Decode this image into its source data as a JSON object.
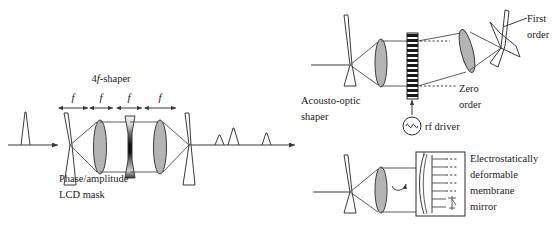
{
  "figure": {
    "background_color": "#ffffff",
    "ink_color": "#3a3a3a",
    "lens_fill_color": "#b4b4b4"
  },
  "panels": {
    "four_f_shaper": {
      "title": "4f-shaper",
      "title_prefix": "4",
      "title_italic": "f",
      "title_suffix": "-shaper",
      "segment_labels": [
        "f",
        "f",
        "f",
        "f"
      ],
      "mask_label_line1": "Phase/amplitude",
      "mask_label_line2": "LCD mask",
      "input_pulse_count": 1,
      "output_pulse_count": 3,
      "output_pulse_heights": [
        10,
        17,
        12
      ],
      "lens_count": 2,
      "grating_count": 2
    },
    "acousto_optic": {
      "label_line1": "Acousto-optic",
      "label_line2": "shaper",
      "first_order_line1": "First",
      "first_order_line2": "order",
      "zero_order_line1": "Zero",
      "zero_order_line2": "order",
      "driver_label": "rf driver",
      "driver_icon": "sine-wave-icon",
      "crystal_stripe_count": 13
    },
    "membrane_mirror": {
      "label_line1": "Electrostatically",
      "label_line2": "deformable",
      "label_line3": "membrane",
      "label_line4": "mirror",
      "electrode_count": 7,
      "arrow_icon": "curved-return-arrow-icon"
    }
  }
}
